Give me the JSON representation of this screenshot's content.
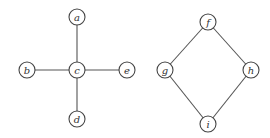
{
  "graphs": [
    {
      "name": "star-graph",
      "nodes": [
        {
          "id": "a",
          "label": "a",
          "x": 77,
          "y": 17
        },
        {
          "id": "b",
          "label": "b",
          "x": 27,
          "y": 70
        },
        {
          "id": "c",
          "label": "c",
          "x": 77,
          "y": 70
        },
        {
          "id": "e",
          "label": "e",
          "x": 127,
          "y": 70
        },
        {
          "id": "d",
          "label": "d",
          "x": 77,
          "y": 119
        }
      ],
      "edges": [
        [
          "a",
          "c"
        ],
        [
          "b",
          "c"
        ],
        [
          "c",
          "e"
        ],
        [
          "c",
          "d"
        ]
      ]
    },
    {
      "name": "cycle-graph",
      "nodes": [
        {
          "id": "f",
          "label": "f",
          "x": 208,
          "y": 22
        },
        {
          "id": "g",
          "label": "g",
          "x": 165,
          "y": 70
        },
        {
          "id": "h",
          "label": "h",
          "x": 251,
          "y": 70
        },
        {
          "id": "i",
          "label": "i",
          "x": 208,
          "y": 124
        }
      ],
      "edges": [
        [
          "f",
          "g"
        ],
        [
          "f",
          "h"
        ],
        [
          "g",
          "i"
        ],
        [
          "h",
          "i"
        ]
      ]
    }
  ],
  "style": {
    "node_radius": 8,
    "stroke": "#444444",
    "background": "#ffffff"
  }
}
